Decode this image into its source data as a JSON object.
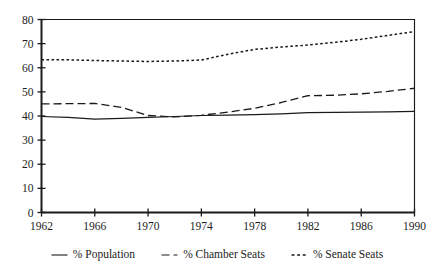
{
  "chart_data": {
    "type": "line",
    "title": "",
    "xlabel": "",
    "ylabel": "",
    "xlim": [
      1962,
      1990
    ],
    "ylim": [
      0,
      80
    ],
    "grid": false,
    "legend_position": "bottom",
    "x_ticks": [
      1962,
      1966,
      1970,
      1974,
      1978,
      1982,
      1986,
      1990
    ],
    "y_ticks": [
      0,
      10,
      20,
      30,
      40,
      50,
      60,
      70,
      80
    ],
    "x": [
      1962,
      1964,
      1966,
      1968,
      1970,
      1972,
      1974,
      1976,
      1978,
      1980,
      1982,
      1984,
      1986,
      1988,
      1990
    ],
    "series": [
      {
        "name": "% Population",
        "style": "solid",
        "color": "#1a1a1a",
        "values": [
          39.8,
          39.4,
          38.7,
          39.0,
          39.4,
          39.8,
          40.2,
          40.4,
          40.6,
          40.9,
          41.4,
          41.5,
          41.6,
          41.7,
          41.9
        ]
      },
      {
        "name": "% Chamber Seats",
        "style": "dashed",
        "color": "#1a1a1a",
        "values": [
          45.0,
          45.1,
          45.2,
          43.6,
          40.2,
          39.6,
          40.3,
          41.6,
          43.2,
          45.6,
          48.4,
          48.6,
          49.2,
          50.2,
          51.5
        ]
      },
      {
        "name": "% Senate Seats",
        "style": "dotted",
        "color": "#1a1a1a",
        "values": [
          63.3,
          63.3,
          63.0,
          62.8,
          62.6,
          62.8,
          63.2,
          65.6,
          67.6,
          68.6,
          69.4,
          70.5,
          71.8,
          73.4,
          75.0
        ]
      }
    ]
  },
  "axis": {
    "y_tick_labels": [
      "0",
      "10",
      "20",
      "30",
      "40",
      "50",
      "60",
      "70",
      "80"
    ],
    "x_tick_labels": [
      "1962",
      "1966",
      "1970",
      "1974",
      "1978",
      "1982",
      "1986",
      "1990"
    ]
  },
  "legend": {
    "items": [
      {
        "label": "% Population",
        "marker": "solid-line-swatch"
      },
      {
        "label": "% Chamber Seats",
        "marker": "dashed-line-swatch"
      },
      {
        "label": "% Senate Seats",
        "marker": "dotted-line-swatch"
      }
    ]
  },
  "colors": {
    "line": "#1a1a1a",
    "axis": "#1a1a1a",
    "background": "#ffffff"
  }
}
